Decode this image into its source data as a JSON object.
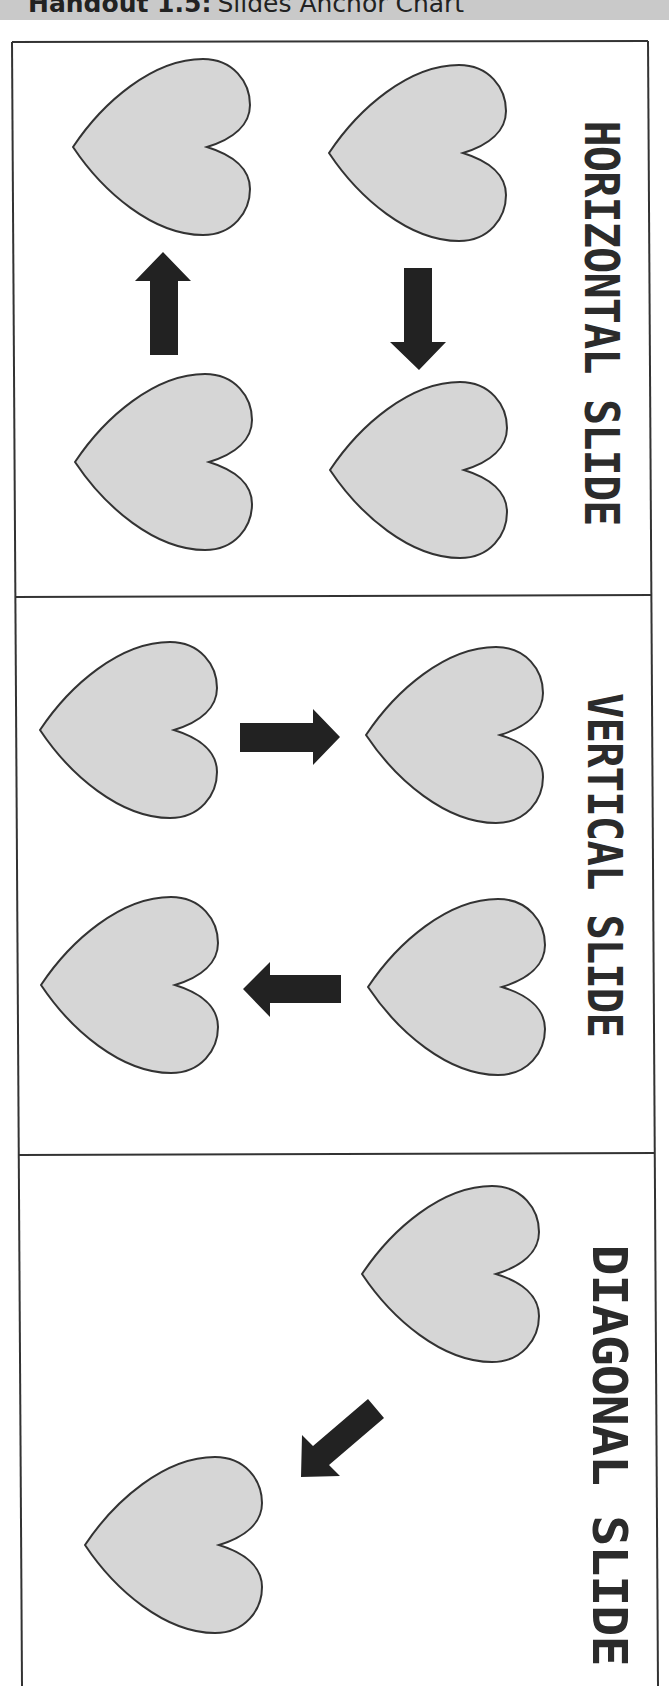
{
  "header": {
    "handout_label": "Handout 1.5:",
    "title": "Slides Anchor Chart",
    "background_color": "#c9c9c9"
  },
  "colors": {
    "heart_fill": "#d6d6d6",
    "heart_stroke": "#333333",
    "arrow_fill": "#222222",
    "frame_stroke": "#333333"
  },
  "panels": [
    {
      "id": "horizontal",
      "label": "HORIZONTAL SLIDE",
      "hearts": [
        "heart",
        "heart",
        "heart",
        "heart"
      ],
      "arrows": [
        {
          "direction": "up",
          "icon": "arrow-up-icon"
        },
        {
          "direction": "down",
          "icon": "arrow-down-icon"
        }
      ]
    },
    {
      "id": "vertical",
      "label": "VERTICAL SLIDE",
      "hearts": [
        "heart",
        "heart",
        "heart",
        "heart"
      ],
      "arrows": [
        {
          "direction": "right",
          "icon": "arrow-right-icon"
        },
        {
          "direction": "left",
          "icon": "arrow-left-icon"
        }
      ]
    },
    {
      "id": "diagonal",
      "label": "DIAGONAL SLIDE",
      "hearts": [
        "heart",
        "heart"
      ],
      "arrows": [
        {
          "direction": "down-left",
          "icon": "arrow-down-left-icon"
        }
      ]
    }
  ]
}
